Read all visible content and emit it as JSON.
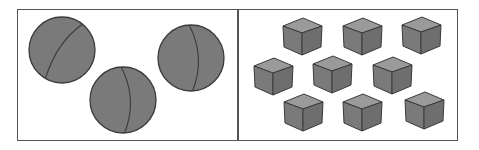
{
  "figure": {
    "panels": [
      {
        "id": "left",
        "object_type": "ball",
        "count": 3,
        "items": [
          {
            "cx": 62,
            "cy": 50,
            "r": 33,
            "seam": "diag"
          },
          {
            "cx": 123,
            "cy": 100,
            "r": 33,
            "seam": "vert"
          },
          {
            "cx": 191,
            "cy": 58,
            "r": 33,
            "seam": "vert"
          }
        ]
      },
      {
        "id": "right",
        "object_type": "cube",
        "count": 9,
        "items": [
          {
            "x": 281,
            "y": 17
          },
          {
            "x": 341,
            "y": 17
          },
          {
            "x": 400,
            "y": 16
          },
          {
            "x": 252,
            "y": 57
          },
          {
            "x": 311,
            "y": 55
          },
          {
            "x": 371,
            "y": 56
          },
          {
            "x": 282,
            "y": 93
          },
          {
            "x": 341,
            "y": 93
          },
          {
            "x": 403,
            "y": 91
          }
        ]
      }
    ],
    "colors": {
      "fill": "#7a7a7a",
      "fill_light": "#8c8c8c",
      "fill_top": "#9a9a9a",
      "fill_side": "#6e6e6e",
      "stroke": "#3a3a3a",
      "frame": "#555555"
    }
  }
}
